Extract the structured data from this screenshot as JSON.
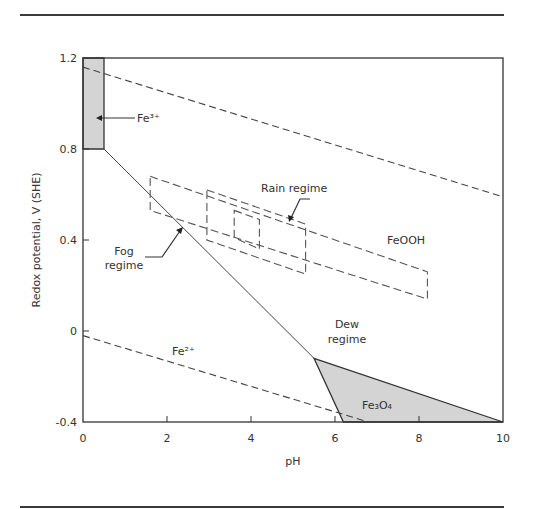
{
  "chart_data": {
    "type": "line",
    "title": "",
    "xlabel": "pH",
    "ylabel": "Redox potential, V (SHE)",
    "xlim": [
      0,
      10
    ],
    "ylim": [
      -0.4,
      1.2
    ],
    "xticks": [
      "0",
      "2",
      "4",
      "6",
      "8",
      "10"
    ],
    "yticks": [
      "1.2",
      "0.8",
      "0.4",
      "0",
      "-0.4"
    ],
    "grid": false,
    "lines": [
      {
        "name": "O2/H2O upper stability limit",
        "style": "dashed",
        "points": [
          [
            0,
            1.16
          ],
          [
            10,
            0.59
          ]
        ]
      },
      {
        "name": "H2O/H2 lower stability limit",
        "style": "dashed",
        "points": [
          [
            0,
            -0.02
          ],
          [
            6.8,
            -0.4
          ]
        ]
      },
      {
        "name": "Fe2+/FeOOH boundary",
        "style": "solid",
        "points": [
          [
            0.5,
            0.8
          ],
          [
            5.5,
            -0.12
          ]
        ]
      }
    ],
    "regions": [
      {
        "name": "Fe3+",
        "fill": "#d4d4d4",
        "points": [
          [
            0,
            1.2
          ],
          [
            0.5,
            1.2
          ],
          [
            0.5,
            0.8
          ],
          [
            0,
            0.8
          ]
        ]
      },
      {
        "name": "Fe3O4",
        "fill": "#d4d4d4",
        "points": [
          [
            5.5,
            -0.12
          ],
          [
            6.2,
            -0.4
          ],
          [
            10,
            -0.4
          ]
        ]
      }
    ],
    "regime_boxes": [
      {
        "name": "Fog regime",
        "style": "dashed",
        "points": [
          [
            1.6,
            0.68
          ],
          [
            8.2,
            0.26
          ],
          [
            8.2,
            0.14
          ],
          [
            1.6,
            0.53
          ]
        ]
      },
      {
        "name": "Rain regime (outer)",
        "style": "dashed",
        "points": [
          [
            2.95,
            0.62
          ],
          [
            5.3,
            0.47
          ],
          [
            5.3,
            0.25
          ],
          [
            2.95,
            0.4
          ]
        ]
      },
      {
        "name": "Rain regime (inner)",
        "style": "dashed",
        "points": [
          [
            3.6,
            0.53
          ],
          [
            4.2,
            0.49
          ],
          [
            4.2,
            0.36
          ],
          [
            3.6,
            0.41
          ]
        ]
      }
    ],
    "annotations": [
      {
        "text": "Fe³⁺",
        "x": 1.25,
        "y": 0.96
      },
      {
        "text": "FeOOH",
        "x": 7.6,
        "y": 0.44
      },
      {
        "text": "Rain regime",
        "x": 5.2,
        "y": 0.6
      },
      {
        "text": "Fog regime",
        "x": 1.7,
        "y": 0.29
      },
      {
        "text": "Dew regime",
        "x": 6.2,
        "y": -0.04
      },
      {
        "text": "Fe²⁺",
        "x": 2.3,
        "y": -0.1
      },
      {
        "text": "Fe₃O₄",
        "x": 7.0,
        "y": -0.32
      }
    ]
  },
  "labels": {
    "fe3": "Fe³⁺",
    "feooh": "FeOOH",
    "rain": "Rain regime",
    "fog1": "Fog",
    "fog2": "regime",
    "dew1": "Dew",
    "dew2": "regime",
    "fe2": "Fe²⁺",
    "fe3o4": "Fe₃O₄",
    "xlabel": "pH",
    "ylabel": "Redox potential, V (SHE)"
  }
}
